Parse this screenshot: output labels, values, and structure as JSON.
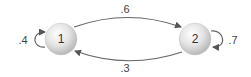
{
  "diagram": {
    "type": "markov-chain",
    "nodes": [
      {
        "id": "1",
        "label": "1"
      },
      {
        "id": "2",
        "label": "2"
      }
    ],
    "edges": [
      {
        "from": "1",
        "to": "2",
        "label": ".6"
      },
      {
        "from": "2",
        "to": "1",
        "label": ".3"
      },
      {
        "from": "1",
        "to": "1",
        "label": ".4"
      },
      {
        "from": "2",
        "to": "2",
        "label": ".7"
      }
    ]
  }
}
